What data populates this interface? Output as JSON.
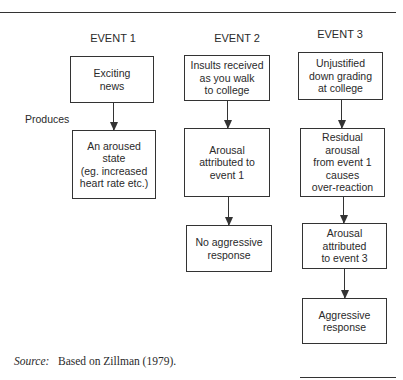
{
  "diagram": {
    "side_label": "Produces",
    "events": [
      {
        "title": "EVENT 1",
        "steps": [
          "Exciting\nnews",
          "An aroused\nstate\n(eg. increased\nheart rate etc.)"
        ]
      },
      {
        "title": "EVENT 2",
        "steps": [
          "Insults received\nas you walk\nto college",
          "Arousal\nattributed to\nevent 1",
          "No aggressive\nresponse"
        ]
      },
      {
        "title": "EVENT 3",
        "steps": [
          "Unjustified\ndown grading\nat college",
          "Residual\narousal\nfrom event 1\ncauses\nover-reaction",
          "Arousal\nattributed\nto event 3",
          "Aggressive\nresponse"
        ]
      }
    ]
  },
  "source": {
    "label": "Source",
    "text": "Based on Zillman (1979)."
  }
}
